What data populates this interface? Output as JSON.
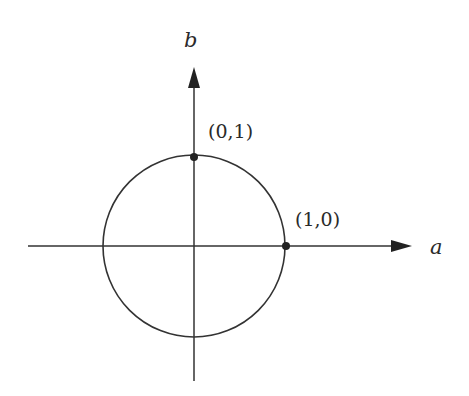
{
  "diagram": {
    "axes": {
      "horizontal": {
        "label": "a"
      },
      "vertical": {
        "label": "b"
      }
    },
    "points": [
      {
        "label": "(0,1)",
        "coords": [
          0,
          1
        ]
      },
      {
        "label": "(1,0)",
        "coords": [
          1,
          0
        ]
      }
    ],
    "circle": {
      "center": [
        0,
        0
      ],
      "radius": 1
    },
    "colors": {
      "stroke": "#333333",
      "background": "#ffffff"
    }
  }
}
